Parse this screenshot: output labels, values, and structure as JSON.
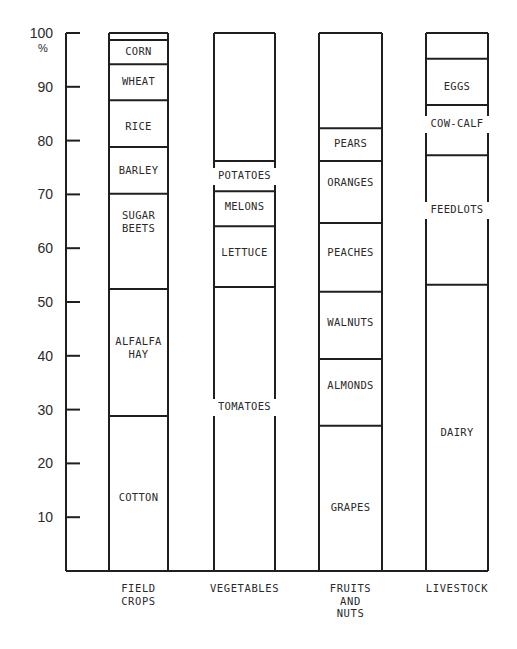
{
  "chart_data": {
    "type": "bar",
    "stacked": true,
    "title": "",
    "xlabel": "",
    "ylabel": "%",
    "ylim": [
      0,
      100
    ],
    "yticks": [
      10,
      20,
      30,
      40,
      50,
      60,
      70,
      80,
      90,
      100
    ],
    "grid": false,
    "legend": "none (segments labeled inline)",
    "categories": [
      {
        "label_lines": [
          "FIELD",
          "CROPS"
        ]
      },
      {
        "label_lines": [
          "VEGETABLES"
        ]
      },
      {
        "label_lines": [
          "FRUITS",
          "AND",
          "NUTS"
        ]
      },
      {
        "label_lines": [
          "LIVESTOCK"
        ]
      }
    ],
    "bars": [
      {
        "category": "FIELD CROPS",
        "segments": [
          {
            "label": [
              "COTTON"
            ],
            "from": 0,
            "to": 28.8
          },
          {
            "label": [
              "ALFALFA",
              "HAY"
            ],
            "from": 28.8,
            "to": 52.4
          },
          {
            "label": [
              "SUGAR",
              "BEETS"
            ],
            "from": 52.4,
            "to": 70.1
          },
          {
            "label": [
              "BARLEY"
            ],
            "from": 70.1,
            "to": 78.8
          },
          {
            "label": [
              "RICE"
            ],
            "from": 78.8,
            "to": 87.5
          },
          {
            "label": [
              "WHEAT"
            ],
            "from": 87.5,
            "to": 94.2
          },
          {
            "label": [
              "CORN"
            ],
            "from": 94.2,
            "to": 98.7
          },
          {
            "label": [],
            "from": 98.7,
            "to": 100
          }
        ]
      },
      {
        "category": "VEGETABLES",
        "segments": [
          {
            "label": [
              "TOMATOES"
            ],
            "from": 0,
            "to": 52.8,
            "label_on_border": true
          },
          {
            "label": [
              "LETTUCE"
            ],
            "from": 52.8,
            "to": 64.1
          },
          {
            "label": [
              "MELONS"
            ],
            "from": 64.1,
            "to": 70.6
          },
          {
            "label": [
              "POTATOES"
            ],
            "from": 70.6,
            "to": 76.2,
            "label_on_border": true
          },
          {
            "label": [],
            "from": 76.2,
            "to": 100
          }
        ]
      },
      {
        "category": "FRUITS AND NUTS",
        "segments": [
          {
            "label": [
              "GRAPES"
            ],
            "from": 0,
            "to": 27.0
          },
          {
            "label": [
              "ALMONDS"
            ],
            "from": 27.0,
            "to": 39.4
          },
          {
            "label": [
              "WALNUTS"
            ],
            "from": 39.4,
            "to": 51.9
          },
          {
            "label": [
              "PEACHES"
            ],
            "from": 51.9,
            "to": 64.7
          },
          {
            "label": [
              "ORANGES"
            ],
            "from": 64.7,
            "to": 76.2
          },
          {
            "label": [
              "PEARS"
            ],
            "from": 76.2,
            "to": 82.3
          },
          {
            "label": [],
            "from": 82.3,
            "to": 100
          }
        ]
      },
      {
        "category": "LIVESTOCK",
        "segments": [
          {
            "label": [
              "DAIRY"
            ],
            "from": 0,
            "to": 53.2
          },
          {
            "label": [
              "FEEDLOTS"
            ],
            "from": 53.2,
            "to": 77.3,
            "label_on_border": true
          },
          {
            "label": [
              "COW-CALF"
            ],
            "from": 77.3,
            "to": 86.6,
            "label_on_border": true
          },
          {
            "label": [
              "EGGS"
            ],
            "from": 86.6,
            "to": 95.2
          },
          {
            "label": [],
            "from": 95.2,
            "to": 100
          }
        ]
      }
    ]
  },
  "layout": {
    "axis_x": 66,
    "axis_top": 33,
    "axis_bottom": 571,
    "axis_right": 488,
    "bar_x": [
      [
        109,
        168
      ],
      [
        214,
        275
      ],
      [
        319,
        382
      ],
      [
        426,
        488
      ]
    ],
    "label_y": {
      "COTTON": 501,
      "ALFALFA": 345,
      "SUGAR": 219,
      "BARLEY": 174,
      "RICE": 130,
      "WHEAT": 85,
      "CORN": 55,
      "TOMATOES": 410,
      "LETTUCE": 256,
      "MELONS": 210,
      "POTATOES": 179,
      "GRAPES": 511,
      "ALMONDS": 389,
      "WALNUTS": 326,
      "PEACHES": 256,
      "ORANGES": 186,
      "PEARS": 147,
      "DAIRY": 436,
      "FEEDLOTS": 213,
      "COW-CALF": 127,
      "EGGS": 90
    },
    "line_color": "#1f1f1f",
    "text_color": "#2a2a2a",
    "background": "#ffffff"
  }
}
